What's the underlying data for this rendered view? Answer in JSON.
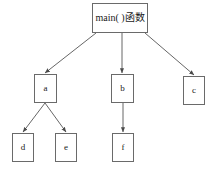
{
  "diagram": {
    "type": "function-call-hierarchy-tree",
    "title": "",
    "colors": {
      "background": "#ffffff",
      "box_border": "#6a6a6a",
      "box_fill": "#ffffff",
      "edge": "#555555",
      "text": "#1a1a1a"
    },
    "nodes": [
      {
        "id": "main",
        "label": "main( )函数",
        "x": 92,
        "y": 3,
        "w": 56,
        "h": 30,
        "level": 0
      },
      {
        "id": "a",
        "label": "a",
        "x": 34,
        "y": 74,
        "w": 23,
        "h": 29,
        "level": 1
      },
      {
        "id": "b",
        "label": "b",
        "x": 111,
        "y": 74,
        "w": 23,
        "h": 29,
        "level": 1
      },
      {
        "id": "c",
        "label": "c",
        "x": 183,
        "y": 76,
        "w": 22,
        "h": 29,
        "level": 1
      },
      {
        "id": "d",
        "label": "d",
        "x": 12,
        "y": 133,
        "w": 22,
        "h": 29,
        "level": 2
      },
      {
        "id": "e",
        "label": "e",
        "x": 55,
        "y": 133,
        "w": 22,
        "h": 29,
        "level": 2
      },
      {
        "id": "f",
        "label": "f",
        "x": 112,
        "y": 133,
        "w": 22,
        "h": 29,
        "level": 2
      }
    ],
    "edges": [
      {
        "id": "main-a",
        "from": "main",
        "to": "a",
        "x1": 96,
        "y1": 33,
        "x2": 45,
        "y2": 73,
        "arrow": true
      },
      {
        "id": "main-b",
        "from": "main",
        "to": "b",
        "x1": 122,
        "y1": 33,
        "x2": 122,
        "y2": 73,
        "arrow": true
      },
      {
        "id": "main-c",
        "from": "main",
        "to": "c",
        "x1": 145,
        "y1": 33,
        "x2": 194,
        "y2": 75,
        "arrow": true
      },
      {
        "id": "a-d",
        "from": "a",
        "to": "d",
        "x1": 45,
        "y1": 103,
        "x2": 23,
        "y2": 132,
        "arrow": true
      },
      {
        "id": "a-e",
        "from": "a",
        "to": "e",
        "x1": 45,
        "y1": 103,
        "x2": 66,
        "y2": 132,
        "arrow": true
      },
      {
        "id": "b-f",
        "from": "b",
        "to": "f",
        "x1": 123,
        "y1": 103,
        "x2": 123,
        "y2": 132,
        "arrow": true
      }
    ]
  }
}
